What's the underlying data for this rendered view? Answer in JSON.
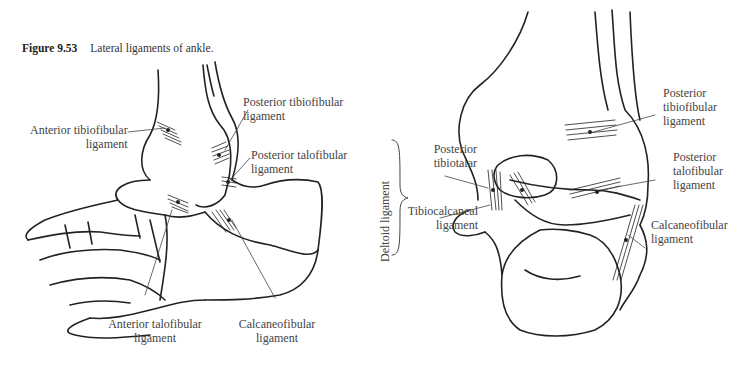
{
  "figure": {
    "number": "Figure 9.53",
    "title": "Lateral ligaments of ankle."
  },
  "left_view": {
    "labels": [
      {
        "id": "anterior-tibiofibular",
        "line1": "Anterior tibiofibular",
        "line2": "ligament"
      },
      {
        "id": "posterior-tibiofibular",
        "line1": "Posterior tibiofibular",
        "line2": "ligament"
      },
      {
        "id": "posterior-talofibular",
        "line1": "Posterior talofibular",
        "line2": "ligament"
      },
      {
        "id": "anterior-talofibular",
        "line1": "Anterior talofibular",
        "line2": "ligament"
      },
      {
        "id": "calcaneofibular",
        "line1": "Calcaneofibular",
        "line2": "ligament"
      }
    ]
  },
  "right_view": {
    "group_label": "Deltoid ligament",
    "labels": [
      {
        "id": "posterior-tibiotalar",
        "line1": "Posterior",
        "line2": "tibiotalar"
      },
      {
        "id": "tibiocalcaneal",
        "line1": "Tibiocalcaneal",
        "line2": "ligament"
      },
      {
        "id": "posterior-tibiofibular",
        "line1": "Posterior",
        "line2": "tibiofibular",
        "line3": "ligament"
      },
      {
        "id": "posterior-talofibular",
        "line1": "Posterior",
        "line2": "talofibular",
        "line3": "ligament"
      },
      {
        "id": "calcaneofibular",
        "line1": "Calcaneofibular",
        "line2": "ligament"
      }
    ]
  }
}
